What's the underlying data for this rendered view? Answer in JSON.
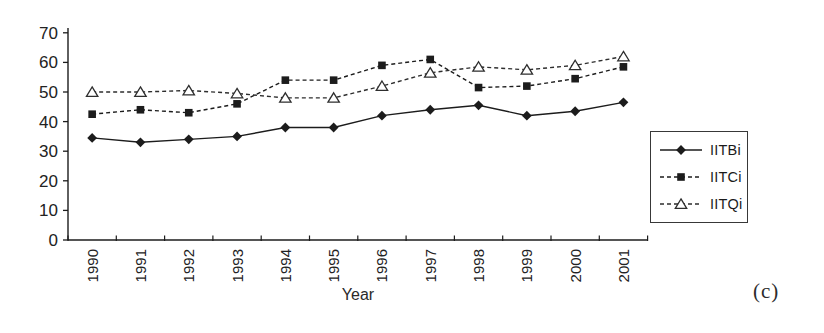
{
  "figure": {
    "panel_label": "(c)",
    "ink_color": "#1c1c1c",
    "background": "#ffffff"
  },
  "chart_data": {
    "type": "line",
    "title": "",
    "xlabel": "Year",
    "ylabel": "",
    "ylim": [
      0,
      70
    ],
    "ytick_step": 10,
    "grid": false,
    "legend_position": "outside-right",
    "categories": [
      "1990",
      "1991",
      "1992",
      "1993",
      "1994",
      "1995",
      "1996",
      "1997",
      "1998",
      "1999",
      "2000",
      "2001"
    ],
    "series": [
      {
        "name": "IITBi",
        "line_style": "solid",
        "marker": "filled-diamond",
        "color": "#1c1c1c",
        "values": [
          34.5,
          33,
          34,
          35,
          38,
          38,
          42,
          44,
          45.5,
          42,
          43.5,
          46.5
        ]
      },
      {
        "name": "IITCi",
        "line_style": "dashed",
        "marker": "filled-square",
        "color": "#1c1c1c",
        "values": [
          42.5,
          44,
          43,
          46,
          54,
          54,
          59,
          61,
          51.5,
          52,
          54.5,
          58.5
        ]
      },
      {
        "name": "IITQi",
        "line_style": "dashed",
        "marker": "open-triangle",
        "color": "#2e2e2e",
        "values": [
          50,
          50,
          50.5,
          49.5,
          48,
          48,
          52,
          56.5,
          58.5,
          57.5,
          59,
          62
        ]
      }
    ]
  }
}
